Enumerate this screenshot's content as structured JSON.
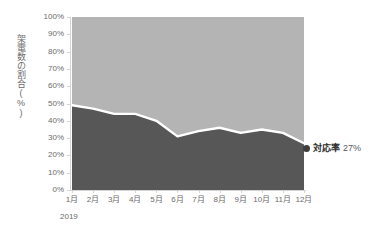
{
  "chart_data": {
    "type": "area",
    "title": "",
    "subtitle": "",
    "xlabel": "",
    "ylabel": "架電数の割合(%)",
    "period_label": "2019",
    "categories": [
      "1月",
      "2月",
      "3月",
      "4月",
      "5月",
      "6月",
      "7月",
      "8月",
      "9月",
      "10月",
      "11月",
      "12月"
    ],
    "ylim": [
      0,
      100
    ],
    "ytick_labels": [
      "0%",
      "10%",
      "20%",
      "30%",
      "40%",
      "50%",
      "60%",
      "70%",
      "80%",
      "90%",
      "100%"
    ],
    "ytick_values": [
      0,
      10,
      20,
      30,
      40,
      50,
      60,
      70,
      80,
      90,
      100
    ],
    "grid": false,
    "legend": "none",
    "stacked_percent": true,
    "series": [
      {
        "name": "対応率",
        "color": "#575757",
        "values": [
          49,
          47,
          44,
          44,
          40,
          31,
          34,
          36,
          33,
          35,
          33,
          27
        ]
      },
      {
        "name": "未対応",
        "color": "#b4b4b4",
        "values": [
          51,
          53,
          56,
          56,
          60,
          69,
          66,
          64,
          67,
          65,
          67,
          73
        ]
      }
    ],
    "annotations": [
      {
        "marker": "dot",
        "name": "対応率",
        "value": "27%",
        "at_category": "12月"
      }
    ],
    "colors": {
      "series_dark": "#575757",
      "series_light": "#b4b4b4",
      "separator": "#ffffff",
      "axis": "#d4d4d4",
      "text": "#6b6b6b",
      "annotation_text": "#2e2e2e"
    }
  }
}
